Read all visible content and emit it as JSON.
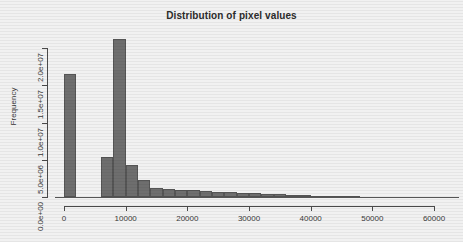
{
  "chart_data": {
    "type": "bar",
    "title": "Distribution of pixel values",
    "xlabel": "",
    "ylabel": "Frequency",
    "xlim": [
      0,
      65000
    ],
    "ylim": [
      0,
      22000000
    ],
    "grid": false,
    "legend": null,
    "bin_width": 2000,
    "x_tick_labels": [
      "0",
      "10000",
      "20000",
      "30000",
      "40000",
      "50000",
      "60000"
    ],
    "x_tick_values": [
      0,
      10000,
      20000,
      30000,
      40000,
      50000,
      60000
    ],
    "y_tick_labels": [
      "0.0e+00",
      "5.0e+06",
      "1.0e+07",
      "1.5e+07",
      "2.0e+07"
    ],
    "y_tick_values": [
      0,
      5000000,
      10000000,
      15000000,
      20000000
    ],
    "bar_color": "#6e6e6e",
    "bar_border_color": "#555555",
    "background_color": "#f1f1f1",
    "axis_color": "#4a4a4a",
    "bins": [
      {
        "x0": 0,
        "x1": 2000,
        "value": 16500000
      },
      {
        "x0": 2000,
        "x1": 4000,
        "value": 0
      },
      {
        "x0": 4000,
        "x1": 6000,
        "value": 0
      },
      {
        "x0": 6000,
        "x1": 8000,
        "value": 5400000
      },
      {
        "x0": 8000,
        "x1": 10000,
        "value": 21200000
      },
      {
        "x0": 10000,
        "x1": 12000,
        "value": 4300000
      },
      {
        "x0": 12000,
        "x1": 14000,
        "value": 2300000
      },
      {
        "x0": 14000,
        "x1": 16000,
        "value": 1250000
      },
      {
        "x0": 16000,
        "x1": 18000,
        "value": 1050000
      },
      {
        "x0": 18000,
        "x1": 20000,
        "value": 950000
      },
      {
        "x0": 20000,
        "x1": 22000,
        "value": 880000
      },
      {
        "x0": 22000,
        "x1": 24000,
        "value": 800000
      },
      {
        "x0": 24000,
        "x1": 26000,
        "value": 720000
      },
      {
        "x0": 26000,
        "x1": 28000,
        "value": 660000
      },
      {
        "x0": 28000,
        "x1": 30000,
        "value": 600000
      },
      {
        "x0": 30000,
        "x1": 32000,
        "value": 520000
      },
      {
        "x0": 32000,
        "x1": 34000,
        "value": 450000
      },
      {
        "x0": 34000,
        "x1": 36000,
        "value": 380000
      },
      {
        "x0": 36000,
        "x1": 38000,
        "value": 320000
      },
      {
        "x0": 38000,
        "x1": 40000,
        "value": 260000
      },
      {
        "x0": 40000,
        "x1": 42000,
        "value": 200000
      },
      {
        "x0": 42000,
        "x1": 44000,
        "value": 160000
      },
      {
        "x0": 44000,
        "x1": 46000,
        "value": 120000
      },
      {
        "x0": 46000,
        "x1": 48000,
        "value": 90000
      },
      {
        "x0": 48000,
        "x1": 50000,
        "value": 60000
      },
      {
        "x0": 50000,
        "x1": 52000,
        "value": 45000
      },
      {
        "x0": 52000,
        "x1": 54000,
        "value": 35000
      },
      {
        "x0": 54000,
        "x1": 56000,
        "value": 25000
      },
      {
        "x0": 56000,
        "x1": 58000,
        "value": 18000
      },
      {
        "x0": 58000,
        "x1": 60000,
        "value": 12000
      },
      {
        "x0": 60000,
        "x1": 62000,
        "value": 8000
      },
      {
        "x0": 62000,
        "x1": 64000,
        "value": 5000
      },
      {
        "x0": 64000,
        "x1": 65000,
        "value": 3000
      }
    ]
  }
}
